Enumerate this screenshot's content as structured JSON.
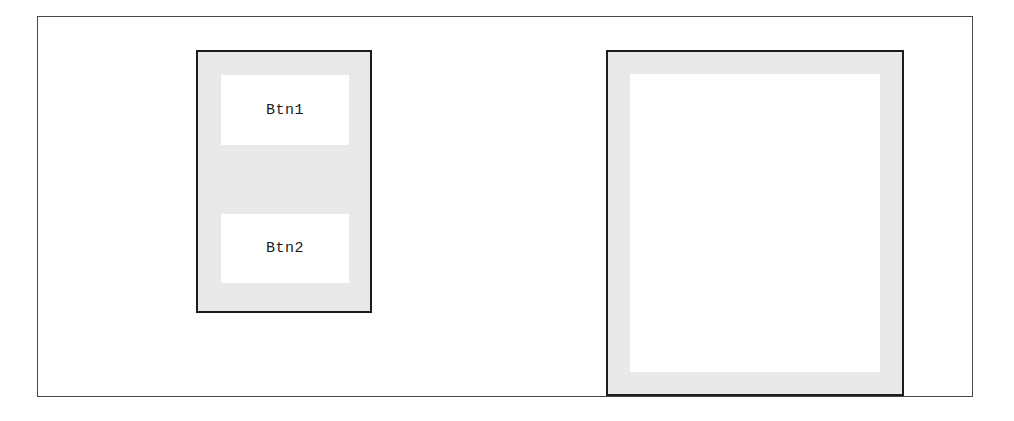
{
  "window": {
    "background_color": "#ffffff",
    "frame_border_color": "#4a4a4a"
  },
  "panels": {
    "button_panel": {
      "name": "button-panel",
      "background_color": "#e9e9e9",
      "border_color": "#1c1c1c",
      "buttons": [
        {
          "label": "Btn1"
        },
        {
          "label": "Btn2"
        }
      ]
    },
    "content_panel": {
      "name": "content-panel",
      "background_color": "#e9e9e9",
      "border_color": "#1c1c1c",
      "inner_background_color": "#ffffff",
      "inner_content": ""
    }
  }
}
